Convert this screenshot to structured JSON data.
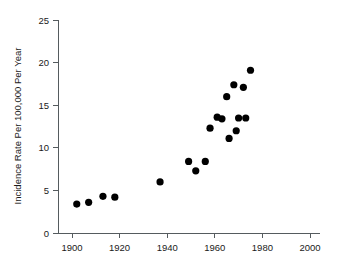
{
  "chart_data": {
    "type": "scatter",
    "title": "",
    "xlabel": "",
    "ylabel": "Incidence Rate Per 100,000 Per Year",
    "xlim": [
      1895,
      2005
    ],
    "ylim": [
      0,
      25
    ],
    "xticks": [
      1900,
      1920,
      1940,
      1960,
      1980,
      2000
    ],
    "xtick_labels": [
      "1900",
      "1920",
      "1940",
      "1960",
      "1980",
      "2000"
    ],
    "yticks": [
      0,
      5,
      10,
      15,
      20,
      25
    ],
    "ytick_labels": [
      "0",
      "5",
      "10",
      "15",
      "20",
      "25"
    ],
    "grid": false,
    "legend": null,
    "marker": "filled-circle",
    "marker_color": "#000000",
    "axis_color": "#555b5e",
    "x": [
      1902,
      1907,
      1913,
      1918,
      1937,
      1949,
      1952,
      1956,
      1958,
      1961,
      1963,
      1965,
      1966,
      1968,
      1969,
      1970,
      1972,
      1973,
      1975
    ],
    "y": [
      3.4,
      3.6,
      4.3,
      4.2,
      6.0,
      8.4,
      7.3,
      8.4,
      12.3,
      13.6,
      13.4,
      16.0,
      11.1,
      17.4,
      12.0,
      13.5,
      17.1,
      13.5,
      19.1
    ],
    "points": [
      {
        "x": 1902,
        "y": 3.4
      },
      {
        "x": 1907,
        "y": 3.6
      },
      {
        "x": 1913,
        "y": 4.3
      },
      {
        "x": 1918,
        "y": 4.2
      },
      {
        "x": 1937,
        "y": 6.0
      },
      {
        "x": 1949,
        "y": 8.4
      },
      {
        "x": 1952,
        "y": 7.3
      },
      {
        "x": 1956,
        "y": 8.4
      },
      {
        "x": 1958,
        "y": 12.3
      },
      {
        "x": 1961,
        "y": 13.6
      },
      {
        "x": 1963,
        "y": 13.4
      },
      {
        "x": 1965,
        "y": 16.0
      },
      {
        "x": 1966,
        "y": 11.1
      },
      {
        "x": 1968,
        "y": 17.4
      },
      {
        "x": 1969,
        "y": 12.0
      },
      {
        "x": 1970,
        "y": 13.5
      },
      {
        "x": 1972,
        "y": 17.1
      },
      {
        "x": 1973,
        "y": 13.5
      },
      {
        "x": 1975,
        "y": 19.1
      }
    ]
  },
  "geometry": {
    "plot_left": 58,
    "plot_right": 320,
    "plot_top": 20,
    "plot_bottom": 233,
    "x_pixel_1900": 72,
    "x_pixel_2000": 310,
    "y_pixel_0": 233,
    "y_pixel_25": 20,
    "marker_radius": 3.6,
    "tick_len_x": 5,
    "tick_len_y": 5
  }
}
